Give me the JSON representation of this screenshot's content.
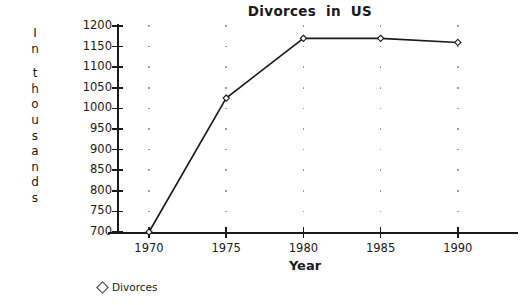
{
  "chart_data": {
    "type": "line",
    "title": "Divorces  in  US",
    "xlabel": "Year",
    "ylabel": "In thousands",
    "ylabel_chars": [
      "I",
      "n",
      "",
      "t",
      "h",
      "o",
      "u",
      "s",
      "a",
      "n",
      "d",
      "s"
    ],
    "categories": [
      "1970",
      "1975",
      "1980",
      "1985",
      "1990"
    ],
    "x": [
      1970,
      1975,
      1980,
      1985,
      1990
    ],
    "series": [
      {
        "name": "Divorces",
        "values": [
          700,
          1025,
          1170,
          1170,
          1160
        ],
        "marker": "diamond-open",
        "color": "#1a1a1a"
      }
    ],
    "ylim": [
      700,
      1200
    ],
    "yticks": [
      1200,
      1150,
      1100,
      1050,
      1000,
      950,
      900,
      850,
      800,
      750,
      700
    ],
    "ytick_labels": [
      "1200",
      "1150",
      "1100",
      "1050",
      "1000",
      "950",
      "900",
      "850",
      "800",
      "750",
      "700"
    ],
    "xticks": [
      1970,
      1975,
      1980,
      1985,
      1990
    ],
    "xtick_labels": [
      "1970",
      "1975",
      "1980",
      "1985",
      "1990"
    ],
    "grid": "vertical-dotted",
    "legend": {
      "position": "bottom-left",
      "entries": [
        {
          "label": "Divorces",
          "marker": "diamond-open"
        }
      ]
    },
    "colors": {
      "background": "#ffffff",
      "axis": "#1a1a1a",
      "line": "#1a1a1a",
      "grid_dot": "#8a8a8a",
      "text": "#1a1a1a"
    }
  }
}
